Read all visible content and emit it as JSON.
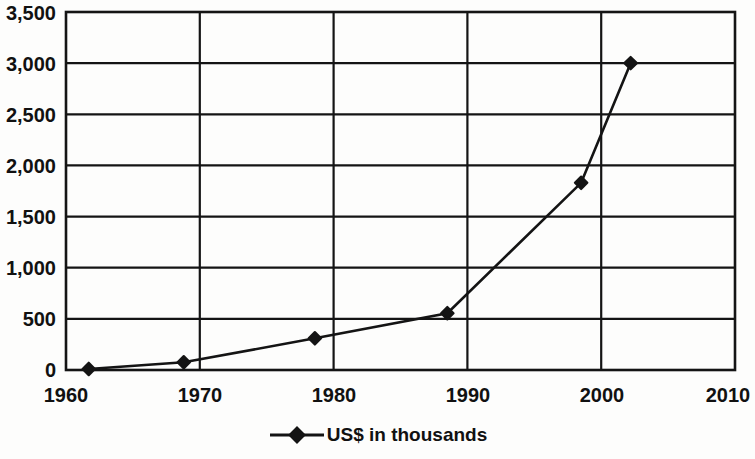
{
  "chart_data": {
    "type": "line",
    "title": "",
    "subtitle": "",
    "xlabel": "",
    "ylabel": "",
    "xlim": [
      1960,
      2010
    ],
    "ylim": [
      0,
      3500
    ],
    "x_ticks": [
      1960,
      1970,
      1980,
      1990,
      2000,
      2010
    ],
    "x_tick_labels": [
      "1960",
      "1970",
      "1980",
      "1990",
      "2000",
      "2010"
    ],
    "y_ticks": [
      0,
      500,
      1000,
      1500,
      2000,
      2500,
      3000,
      3500
    ],
    "y_tick_labels": [
      "0",
      "500",
      "1,000",
      "1,500",
      "2,000",
      "2,500",
      "3,000",
      "3,500"
    ],
    "grid": true,
    "grid_axes": "both",
    "legend_position": "bottom-center",
    "marker": "diamond",
    "line_color": "#141414",
    "marker_color": "#141414",
    "series": [
      {
        "name": "US$ in thousands",
        "x": [
          1961.7,
          1968.8,
          1978.6,
          1988.5,
          1998.5,
          2002.2
        ],
        "values": [
          10,
          75,
          310,
          555,
          1830,
          3000
        ]
      }
    ]
  },
  "legend": {
    "entries": [
      {
        "label": "US$ in thousands",
        "marker": "diamond-line-marker",
        "color": "#141414"
      }
    ]
  },
  "colors": {
    "line": "#141414",
    "marker": "#141414",
    "axis": "#141414",
    "grid": "#141414",
    "text": "#111111",
    "background": "#fdfdfc"
  }
}
